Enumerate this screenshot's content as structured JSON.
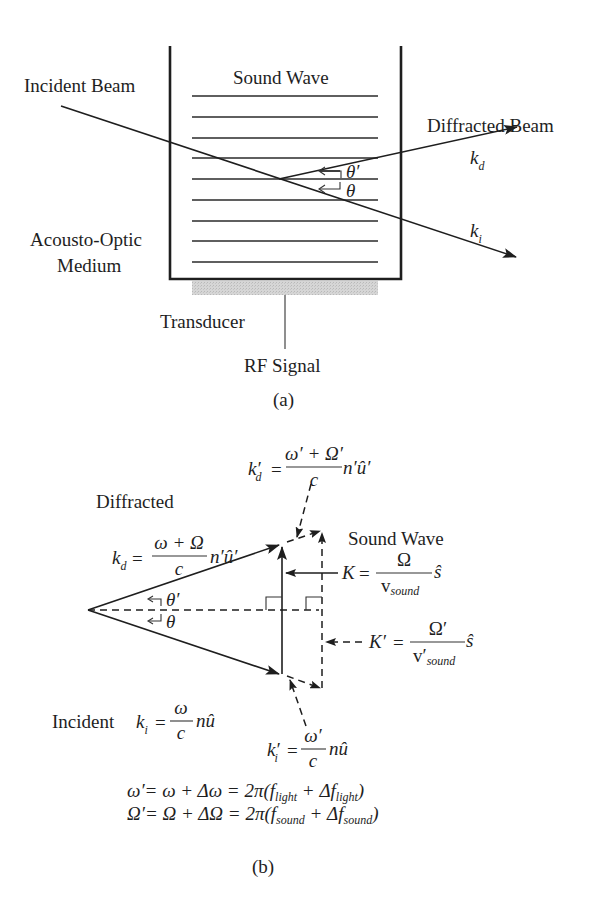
{
  "figure_a": {
    "labels": {
      "incident_beam": "Incident Beam",
      "sound_wave": "Sound Wave",
      "diffracted_beam": "Diffracted Beam",
      "medium_line1": "Acousto-Optic",
      "medium_line2": "Medium",
      "transducer": "Transducer",
      "rf_signal": "RF Signal",
      "caption": "(a)"
    },
    "symbols": {
      "k": "k",
      "d_sub": "d",
      "i_sub": "i",
      "theta": "θ",
      "theta_prime": "θ′"
    },
    "sound_wave_line_count": 9
  },
  "figure_b": {
    "labels": {
      "diffracted": "Diffracted",
      "incident": "Incident",
      "sound_wave": "Sound Wave",
      "caption": "(b)"
    },
    "formulas": {
      "kd": {
        "lhs": "k",
        "sub": "d",
        "eq": "=",
        "num": "ω + Ω",
        "den": "c",
        "tail": "n′û′"
      },
      "kd_prime": {
        "lhs": "k′",
        "sub": "d",
        "eq": "=",
        "num": "ω′ + Ω′",
        "den": "c",
        "tail": "n′û′"
      },
      "ki": {
        "lhs": "k",
        "sub": "i",
        "eq": "=",
        "num": "ω",
        "den": "c",
        "tail": "nû"
      },
      "ki_prime": {
        "lhs": "k′",
        "sub": "i",
        "eq": "=",
        "num": "ω′",
        "den": "c",
        "tail": "nû"
      },
      "K": {
        "lhs": "K",
        "eq": "=",
        "num": "Ω",
        "den": "v",
        "den_sub": "sound",
        "tail": "ŝ"
      },
      "K_prime": {
        "lhs": "K′",
        "eq": "=",
        "num": "Ω′",
        "den": "v′",
        "den_sub": "sound",
        "tail": "ŝ"
      }
    },
    "angles": {
      "theta": "θ",
      "theta_prime": "θ′"
    },
    "equations": {
      "omega_prime": {
        "lhs": "ω′= ω + Δω = 2π(",
        "f1": "f",
        "f1_sub": "light",
        "plus": " + Δ",
        "f2": "f",
        "f2_sub": "light",
        "close": ")"
      },
      "Omega_prime": {
        "lhs": "Ω′= Ω + ΔΩ = 2π(",
        "f1": "f",
        "f1_sub": "sound",
        "plus": " + Δ",
        "f2": "f",
        "f2_sub": "sound",
        "close": ")"
      }
    }
  },
  "colors": {
    "ink": "#1e1e1e",
    "transducer_fill": "#cfcfcf",
    "background": "#ffffff"
  }
}
